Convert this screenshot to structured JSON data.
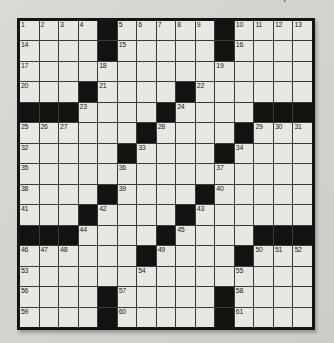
{
  "page": {
    "background": "#d6d4d0",
    "scan_artifact": "'"
  },
  "puzzle": {
    "kind": "crossword",
    "rows": 15,
    "cols": 15,
    "colors": {
      "paper": "#d6d4d0",
      "cell_fill": "#e9e7e1",
      "black_square": "#121211",
      "grid_line": "#3a3a38",
      "outer_border": "#141414",
      "number_text": "#1c1c1a"
    },
    "grid": [
      [
        "1",
        "2",
        "3",
        "4",
        "#",
        "5",
        "6",
        "7",
        "8",
        "9",
        "#",
        "10",
        "11",
        "12",
        "13"
      ],
      [
        "14",
        "",
        "",
        "",
        "#",
        "15",
        "",
        "",
        "",
        "",
        "#",
        "16",
        "",
        "",
        ""
      ],
      [
        "17",
        "",
        "",
        "",
        "18",
        "",
        "",
        "",
        "",
        "",
        "19",
        "",
        "",
        "",
        ""
      ],
      [
        "20",
        "",
        "",
        "#",
        "21",
        "",
        "",
        "",
        "#",
        "22",
        "",
        "",
        "",
        "",
        ""
      ],
      [
        "#",
        "#",
        "#",
        "23",
        "",
        "",
        "",
        "#",
        "24",
        "",
        "",
        "",
        "#",
        "#",
        "#"
      ],
      [
        "25",
        "26",
        "27",
        "",
        "",
        "",
        "#",
        "28",
        "",
        "",
        "",
        "#",
        "29",
        "30",
        "31"
      ],
      [
        "32",
        "",
        "",
        "",
        "",
        "#",
        "33",
        "",
        "",
        "",
        "#",
        "34",
        "",
        "",
        ""
      ],
      [
        "35",
        "",
        "",
        "",
        "",
        "36",
        "",
        "",
        "",
        "",
        "37",
        "",
        "",
        "",
        ""
      ],
      [
        "38",
        "",
        "",
        "",
        "#",
        "39",
        "",
        "",
        "",
        "#",
        "40",
        "",
        "",
        "",
        ""
      ],
      [
        "41",
        "",
        "",
        "#",
        "42",
        "",
        "",
        "",
        "#",
        "43",
        "",
        "",
        "",
        "",
        ""
      ],
      [
        "#",
        "#",
        "#",
        "44",
        "",
        "",
        "",
        "#",
        "45",
        "",
        "",
        "",
        "#",
        "#",
        "#"
      ],
      [
        "46",
        "47",
        "48",
        "",
        "",
        "",
        "#",
        "49",
        "",
        "",
        "",
        "#",
        "50",
        "51",
        "52"
      ],
      [
        "53",
        "",
        "",
        "",
        "",
        "",
        "54",
        "",
        "",
        "",
        "",
        "55",
        "",
        "",
        ""
      ],
      [
        "56",
        "",
        "",
        "",
        "#",
        "57",
        "",
        "",
        "",
        "",
        "#",
        "58",
        "",
        "",
        ""
      ],
      [
        "59",
        "",
        "",
        "",
        "#",
        "60",
        "",
        "",
        "",
        "",
        "#",
        "61",
        "",
        "",
        ""
      ]
    ]
  }
}
